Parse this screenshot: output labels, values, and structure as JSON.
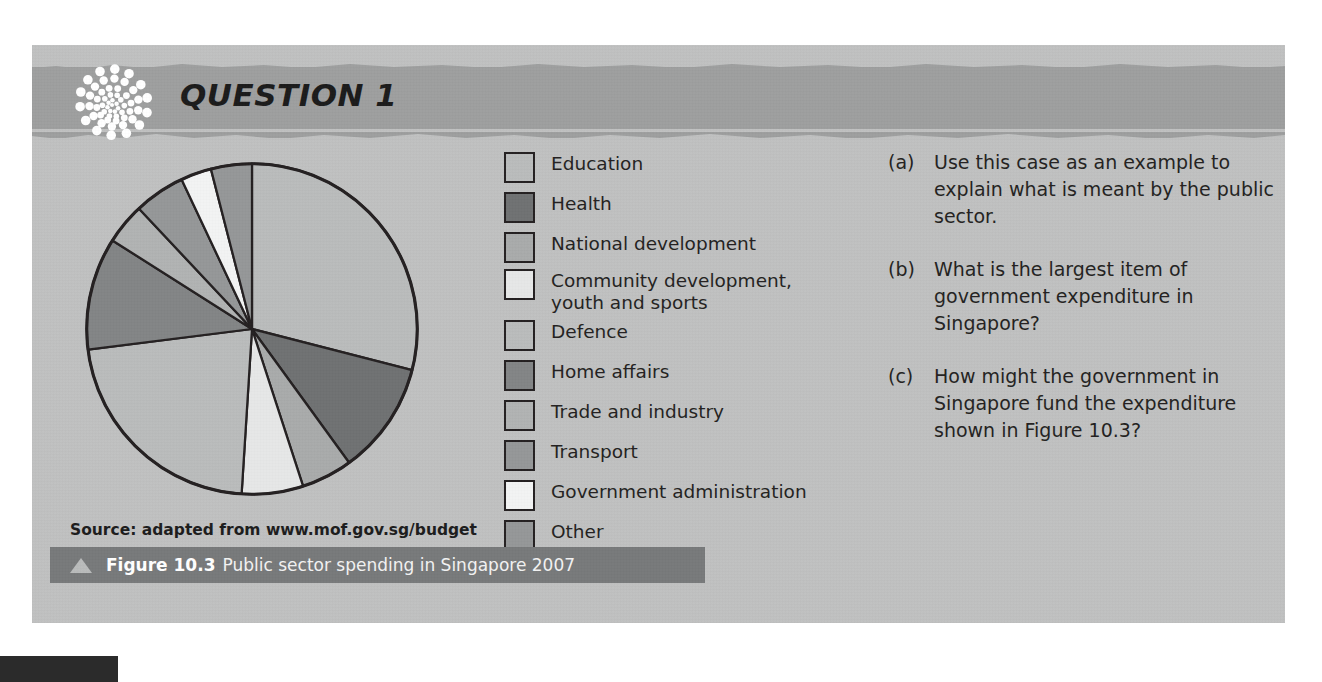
{
  "header": {
    "title": "QUESTION 1",
    "logo_icon": "dot-spiral-logo-icon"
  },
  "figure": {
    "source": "Source: adapted from www.mof.gov.sg/budget",
    "caption_label": "Figure 10.3",
    "caption_text": "Public sector spending in Singapore 2007",
    "caption_icon": "triangle-marker-icon"
  },
  "legend": {
    "items": [
      {
        "label": "Education",
        "color": "#b9bbbb"
      },
      {
        "label": "Health",
        "color": "#6f7172"
      },
      {
        "label": "National development",
        "color": "#a8aaaa"
      },
      {
        "label": "Community development,\nyouth and sports",
        "color": "#e6e7e7"
      },
      {
        "label": "Defence",
        "color": "#b9bbbb"
      },
      {
        "label": "Home affairs",
        "color": "#828485"
      },
      {
        "label": "Trade and industry",
        "color": "#b0b2b2"
      },
      {
        "label": "Transport",
        "color": "#949697"
      },
      {
        "label": "Government administration",
        "color": "#f2f3f3"
      },
      {
        "label": "Other",
        "color": "#949697"
      }
    ]
  },
  "questions": {
    "items": [
      {
        "marker": "(a)",
        "text": "Use this case as an example to explain what is meant by the public sector."
      },
      {
        "marker": "(b)",
        "text": "What is the largest item of government expenditure in Singapore?"
      },
      {
        "marker": "(c)",
        "text": "How might the government in Singapore fund the expenditure shown in Figure 10.3?"
      }
    ]
  },
  "chart_data": {
    "type": "pie",
    "title": "Public sector spending in Singapore 2007",
    "source": "adapted from www.mof.gov.sg/budget",
    "start_angle_deg": 0,
    "direction": "clockwise",
    "stroke": "#231f20",
    "labels": [
      "Education",
      "Health",
      "National development",
      "Community development, youth and sports",
      "Defence",
      "Home affairs",
      "Trade and industry",
      "Transport",
      "Government administration",
      "Other"
    ],
    "values": [
      29,
      11,
      5,
      6,
      22,
      11,
      4,
      5,
      3,
      4
    ],
    "colors": [
      "#b9bbbb",
      "#6f7172",
      "#a8aaaa",
      "#e6e7e7",
      "#b9bbbb",
      "#828485",
      "#b0b2b2",
      "#949697",
      "#f2f3f3",
      "#949697"
    ],
    "legend_position": "right",
    "grid": false
  },
  "colors": {
    "panel_bg": "#bfc0c0",
    "header_band": "#9d9e9e",
    "caption_bar": "#77797a",
    "page_bg": "#ffffff",
    "ink": "#231f20"
  }
}
